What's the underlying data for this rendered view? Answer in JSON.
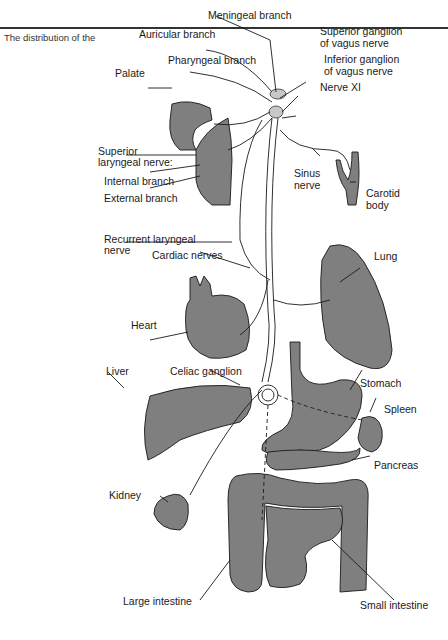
{
  "caption": "The distribution of the",
  "colors": {
    "organ_fill": "#7f7f7f",
    "ganglion_fill": "#c8c8c8",
    "line": "#1a1a1a",
    "rule": "#333333"
  },
  "labels": {
    "meningeal": "Meningeal branch",
    "auricular": "Auricular branch",
    "pharyngeal": "Pharyngeal branch",
    "palate": "Palate",
    "superior_ganglion_1": "Superior ganglion",
    "superior_ganglion_2": "of vagus nerve",
    "inferior_ganglion_1": "Inferior ganglion",
    "inferior_ganglion_2": "of vagus nerve",
    "nerve_xi": "Nerve XI",
    "superior_laryngeal_1": "Superior",
    "superior_laryngeal_2": "laryngeal nerve:",
    "internal_branch": "Internal branch",
    "external_branch": "External branch",
    "sinus_1": "Sinus",
    "sinus_2": "nerve",
    "carotid_1": "Carotid",
    "carotid_2": "body",
    "recurrent_1": "Recurrent laryngeal",
    "recurrent_2": "nerve",
    "cardiac": "Cardiac nerves",
    "lung": "Lung",
    "heart": "Heart",
    "liver": "Liver",
    "celiac": "Celiac ganglion",
    "stomach": "Stomach",
    "spleen": "Spleen",
    "pancreas": "Pancreas",
    "kidney": "Kidney",
    "large_intestine": "Large intestine",
    "small_intestine": "Small intestine"
  }
}
